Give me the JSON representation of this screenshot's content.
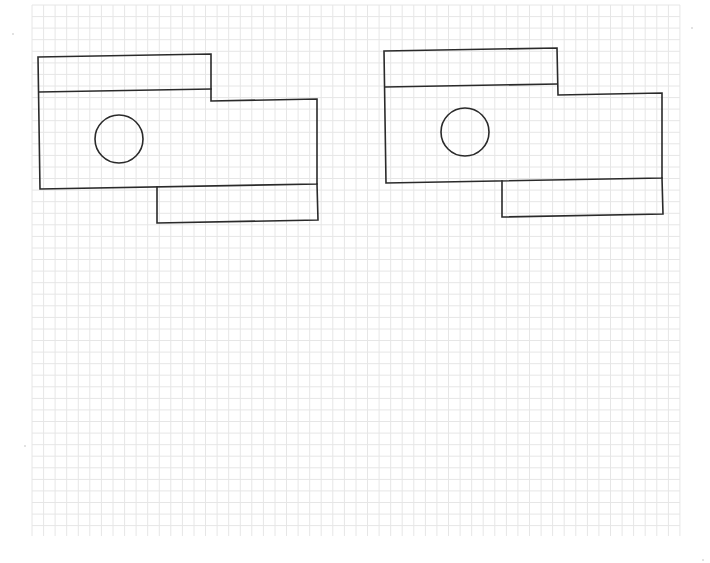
{
  "page": {
    "type": "graph-paper-sketch",
    "background_color": "#ffffff",
    "grid": {
      "x_start": 32,
      "x_end": 680,
      "y_start": 5,
      "y_end": 536,
      "spacing": 11.57,
      "color": "#e6e6e6"
    },
    "ink_color": "#2a2a2a"
  },
  "diagrams": [
    {
      "name": "left-view",
      "polylines": [
        {
          "name": "outline",
          "points": [
            [
              38,
              57
            ],
            [
              211,
              54
            ],
            [
              211,
              101
            ],
            [
              317,
              99
            ],
            [
              317,
              184
            ],
            [
              40,
              189
            ],
            [
              38,
              57
            ]
          ]
        },
        {
          "name": "horizontal-divider",
          "points": [
            [
              39,
              92
            ],
            [
              211,
              89
            ]
          ]
        },
        {
          "name": "lower-tab",
          "points": [
            [
              157,
              187
            ],
            [
              157,
              223
            ],
            [
              318,
              220
            ],
            [
              317,
              184
            ]
          ]
        }
      ],
      "circle": {
        "cx": 119,
        "cy": 139,
        "r": 24
      }
    },
    {
      "name": "right-view",
      "polylines": [
        {
          "name": "outline",
          "points": [
            [
              384,
              51
            ],
            [
              557,
              48
            ],
            [
              558,
              95
            ],
            [
              662,
              93
            ],
            [
              662,
              178
            ],
            [
              386,
              183
            ],
            [
              384,
              51
            ]
          ]
        },
        {
          "name": "horizontal-divider",
          "points": [
            [
              385,
              87
            ],
            [
              557,
              84
            ]
          ]
        },
        {
          "name": "lower-tab",
          "points": [
            [
              502,
              181
            ],
            [
              502,
              217
            ],
            [
              663,
              214
            ],
            [
              662,
              178
            ]
          ]
        }
      ],
      "circle": {
        "cx": 465,
        "cy": 132,
        "r": 24
      }
    }
  ],
  "specks": [
    {
      "x": 13,
      "y": 34,
      "r": 1
    },
    {
      "x": 25,
      "y": 446,
      "r": 1
    },
    {
      "x": 692,
      "y": 28,
      "r": 1
    },
    {
      "x": 703,
      "y": 560,
      "r": 1
    }
  ]
}
